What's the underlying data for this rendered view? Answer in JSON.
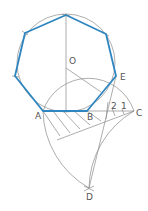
{
  "diagram": {
    "labels": {
      "A": "A",
      "B": "B",
      "C": "C",
      "D": "D",
      "E": "E",
      "O": "O",
      "div1": "1",
      "div2": "2"
    },
    "colors": {
      "polygon": "#2e86c1",
      "construction": "#8a8a8a",
      "text": "#555555"
    }
  }
}
